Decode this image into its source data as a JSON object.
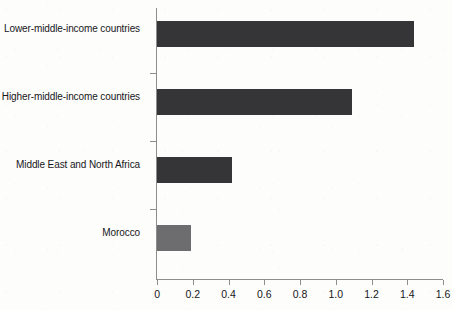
{
  "chart_data": {
    "type": "bar",
    "orientation": "horizontal",
    "title": "",
    "xlabel": "",
    "ylabel": "",
    "xlim": [
      0,
      1.6
    ],
    "grid": false,
    "legend": false,
    "categories": [
      "Lower-middle-income countries",
      "Higher-middle-income countries",
      "Middle East and North Africa",
      "Morocco"
    ],
    "values": [
      1.44,
      1.09,
      0.42,
      0.19
    ],
    "xticks": [
      "0",
      "0.2",
      "0.4",
      "0.6",
      "0.8",
      "1.0",
      "1.2",
      "1.4",
      "1.6"
    ],
    "xtick_values": [
      0,
      0.2,
      0.4,
      0.6,
      0.8,
      1.0,
      1.2,
      1.4,
      1.6
    ],
    "bar_colors": [
      "#353537",
      "#353537",
      "#353537",
      "#6d6d6f"
    ],
    "axis_color": "#8d8d8d",
    "background_color": "#fdfdfc",
    "text_color": "#17171a"
  }
}
